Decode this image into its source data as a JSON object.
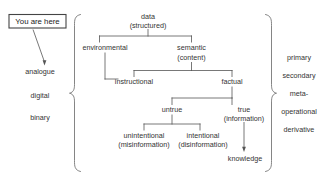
{
  "diagram": {
    "marker": {
      "label": "You are here",
      "name": "you-are-here-box"
    },
    "left_scale": {
      "name": "analogue-digital-binary-scale",
      "items": [
        {
          "label": "analogue"
        },
        {
          "label": "digital"
        },
        {
          "label": "binary"
        }
      ]
    },
    "right_scale": {
      "name": "primary-secondary-meta-scale",
      "items": [
        {
          "label": "primary"
        },
        {
          "label": "secondary"
        },
        {
          "label": "meta-"
        },
        {
          "label": "operational"
        },
        {
          "label": "derivative"
        }
      ]
    },
    "nodes": [
      {
        "id": "data",
        "line1": "data",
        "line2": "(structured)"
      },
      {
        "id": "environmental",
        "line1": "environmental",
        "line2": ""
      },
      {
        "id": "semantic",
        "line1": "semantic",
        "line2": "(content)"
      },
      {
        "id": "instructional",
        "line1": "instructional",
        "line2": ""
      },
      {
        "id": "factual",
        "line1": "factual",
        "line2": ""
      },
      {
        "id": "untrue",
        "line1": "untrue",
        "line2": ""
      },
      {
        "id": "true",
        "line1": "true",
        "line2": "(information)"
      },
      {
        "id": "unintentional",
        "line1": "unintentional",
        "line2": "(misinformation)"
      },
      {
        "id": "intentional",
        "line1": "intentional",
        "line2": "(disinformation)"
      },
      {
        "id": "knowledge",
        "line1": "knowledge",
        "line2": ""
      }
    ],
    "edges": [
      {
        "from": "data",
        "to": "environmental"
      },
      {
        "from": "data",
        "to": "semantic"
      },
      {
        "from": "environmental",
        "to": "instructional"
      },
      {
        "from": "semantic",
        "to": "instructional"
      },
      {
        "from": "semantic",
        "to": "factual"
      },
      {
        "from": "factual",
        "to": "untrue"
      },
      {
        "from": "factual",
        "to": "true"
      },
      {
        "from": "untrue",
        "to": "unintentional"
      },
      {
        "from": "untrue",
        "to": "intentional"
      },
      {
        "from": "true",
        "to": "knowledge",
        "style": "arrow"
      },
      {
        "from": "you-are-here",
        "to": "analogue",
        "style": "arrow"
      }
    ],
    "colors": {
      "line": "#555555",
      "text": "#333333",
      "brace": "#666666",
      "background": "#ffffff"
    }
  }
}
